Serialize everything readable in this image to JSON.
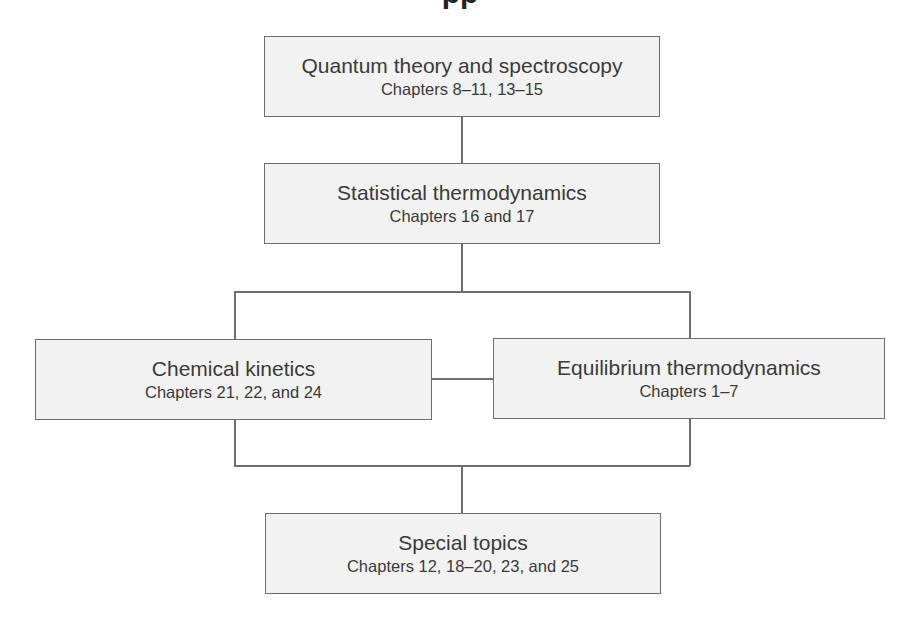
{
  "header": {
    "title_fragment": "pp"
  },
  "nodes": {
    "quantum": {
      "title": "Quantum theory and spectroscopy",
      "subtitle": "Chapters 8–11, 13–15"
    },
    "statistical": {
      "title": "Statistical thermodynamics",
      "subtitle": "Chapters 16 and 17"
    },
    "kinetics": {
      "title": "Chemical kinetics",
      "subtitle": "Chapters 21, 22, and 24"
    },
    "equilibrium": {
      "title": "Equilibrium thermodynamics",
      "subtitle": "Chapters 1–7"
    },
    "special": {
      "title": "Special topics",
      "subtitle": "Chapters 12, 18–20, 23, and 25"
    }
  },
  "edges": [
    {
      "from": "quantum",
      "to": "statistical"
    },
    {
      "from": "statistical",
      "to": "kinetics"
    },
    {
      "from": "statistical",
      "to": "equilibrium"
    },
    {
      "from": "kinetics",
      "to": "equilibrium"
    },
    {
      "from": "kinetics",
      "to": "special"
    },
    {
      "from": "equilibrium",
      "to": "special"
    }
  ],
  "colors": {
    "box_fill": "#f2f2f2",
    "box_border": "#6e6e6e",
    "text": "#3a3a3a",
    "background": "#ffffff"
  }
}
